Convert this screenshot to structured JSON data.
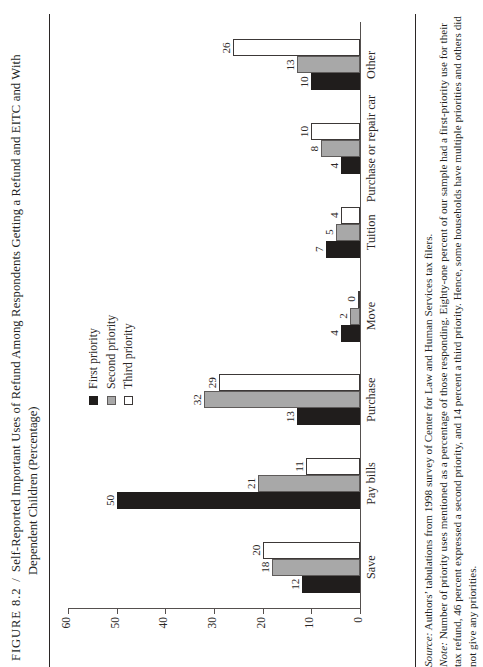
{
  "figure": {
    "number": "FIGURE 8.2",
    "separator": "/",
    "title_line1": "Self-Reported Important Uses of Refund Among Respondents Getting a Refund and EITC and With",
    "title_line2": "Dependent Children (Percentage)"
  },
  "notes": {
    "source_label": "Source:",
    "source_text": " Authors’ tabulations from 1998 survey of Center for Law and Human Services tax filers.",
    "note_label": "Note:",
    "note_text": " Number of priority uses mentioned as a percentage of those responding. Eighty-one percent of our sample had a first-priority use for their tax refund, 46 percent expressed a second priority, and 14 percent a third priority. Hence, some households have multiple priorities and others did not give any priorities."
  },
  "chart_data": {
    "type": "bar",
    "title": "Self-Reported Important Uses of Refund Among Respondents Getting a Refund and EITC and With Dependent Children (Percentage)",
    "xlabel": "",
    "ylabel": "Respondents’ Priority Use",
    "ylim": [
      0,
      60
    ],
    "yticks": [
      0,
      10,
      20,
      30,
      40,
      50,
      60
    ],
    "grid": false,
    "legend_position": "upper center",
    "categories": [
      "Save",
      "Pay bills",
      "Purchase",
      "Move",
      "Tuition",
      "Purchase or repair car",
      "Other"
    ],
    "series": [
      {
        "name": "First priority",
        "color": "#201d1c",
        "values": [
          12,
          50,
          13,
          4,
          7,
          4,
          10
        ]
      },
      {
        "name": "Second priority",
        "color": "#a8a8a8",
        "values": [
          18,
          21,
          32,
          2,
          5,
          8,
          13
        ]
      },
      {
        "name": "Third priority",
        "color": "#ffffff",
        "values": [
          20,
          11,
          29,
          0,
          4,
          10,
          26
        ]
      }
    ]
  }
}
